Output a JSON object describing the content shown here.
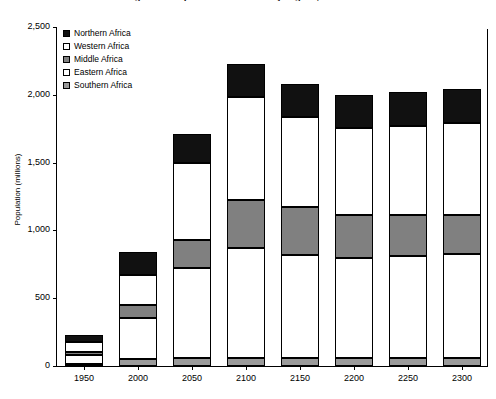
{
  "chart_data": {
    "type": "bar",
    "stacked": true,
    "title": "Figure 1. Population of Africa by region, 1950-2300",
    "xlabel": "",
    "ylabel": "Population (millions)",
    "ylim": [
      0,
      2500
    ],
    "ytick_values": [
      0,
      500,
      1000,
      1500,
      2000,
      2500
    ],
    "ytick_labels": [
      "0",
      "500",
      "1,000",
      "1,500",
      "2,000",
      "2,500"
    ],
    "grid": false,
    "legend_position": "upper-left-inside",
    "categories": [
      "1950",
      "2000",
      "2050",
      "2100",
      "2150",
      "2200",
      "2250",
      "2300"
    ],
    "series": [
      {
        "name": "Northern Africa",
        "color": "#111111",
        "values": [
          50,
          170,
          215,
          240,
          245,
          245,
          250,
          250
        ]
      },
      {
        "name": "Western Africa",
        "color": "#ffffff",
        "values": [
          70,
          225,
          570,
          760,
          665,
          640,
          660,
          680
        ]
      },
      {
        "name": "Middle Africa",
        "color": "#808080",
        "values": [
          26,
          96,
          200,
          360,
          355,
          320,
          300,
          285
        ]
      },
      {
        "name": "Eastern Africa",
        "color": "#ffffff",
        "values": [
          65,
          300,
          670,
          810,
          760,
          740,
          755,
          770
        ]
      },
      {
        "name": "Southern Africa",
        "color": "#9a9a9a",
        "values": [
          16,
          51,
          56,
          57,
          56,
          56,
          57,
          57
        ]
      }
    ],
    "totals": [
      227,
      842,
      1711,
      2227,
      2081,
      2001,
      2022,
      2042
    ]
  },
  "legend": {
    "items": [
      {
        "label": "Northern Africa",
        "swatch": "black-square-icon"
      },
      {
        "label": "Western Africa",
        "swatch": "white-square-icon"
      },
      {
        "label": "Middle Africa",
        "swatch": "gray-square-icon"
      },
      {
        "label": "Eastern Africa",
        "swatch": "white-square-icon"
      },
      {
        "label": "Southern Africa",
        "swatch": "light-gray-square-icon"
      }
    ]
  }
}
